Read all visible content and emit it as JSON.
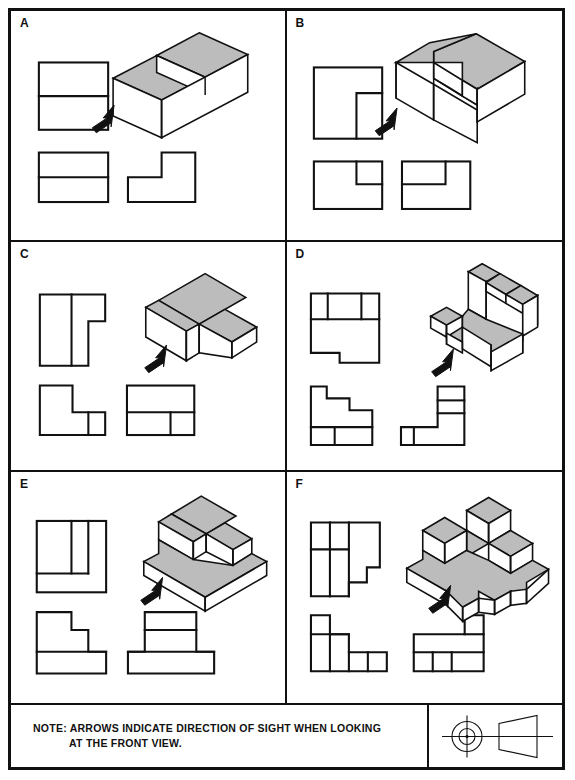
{
  "sheet": {
    "title": "Orthographic Projection Exercise Sheet",
    "panels": [
      {
        "id": "A",
        "label": "A",
        "object": "two-step block",
        "arrow": "direction-of-sight-arrow",
        "views": [
          "top-view",
          "front-view",
          "right-side-view",
          "isometric-view"
        ]
      },
      {
        "id": "B",
        "label": "B",
        "object": "block with rectangular corner pocket",
        "arrow": "direction-of-sight-arrow",
        "views": [
          "top-view",
          "front-view",
          "right-side-view",
          "isometric-view"
        ]
      },
      {
        "id": "C",
        "label": "C",
        "object": "L-shaped block with low ledge",
        "arrow": "direction-of-sight-arrow",
        "views": [
          "top-view",
          "front-view",
          "right-side-view",
          "isometric-view"
        ]
      },
      {
        "id": "D",
        "label": "D",
        "object": "L-base with descending staircase",
        "arrow": "direction-of-sight-arrow",
        "views": [
          "top-view",
          "front-view",
          "right-side-view",
          "isometric-view"
        ]
      },
      {
        "id": "E",
        "label": "E",
        "object": "three-tier stepped pyramid on base",
        "arrow": "direction-of-sight-arrow",
        "views": [
          "top-view",
          "front-view",
          "right-side-view",
          "isometric-view"
        ]
      },
      {
        "id": "F",
        "label": "F",
        "object": "cross-shaped base with stacked cubes",
        "arrow": "direction-of-sight-arrow",
        "views": [
          "top-view",
          "front-view",
          "right-side-view",
          "isometric-view"
        ]
      }
    ]
  },
  "note": {
    "line1": "NOTE:  ARROWS INDICATE DIRECTION OF SIGHT WHEN LOOKING",
    "line2": "AT THE FRONT VIEW.",
    "projection_symbol": "third-angle-projection-symbol"
  },
  "colors": {
    "ink": "#111111",
    "shaded_face": "#bcbcbc",
    "paper": "#ffffff"
  }
}
